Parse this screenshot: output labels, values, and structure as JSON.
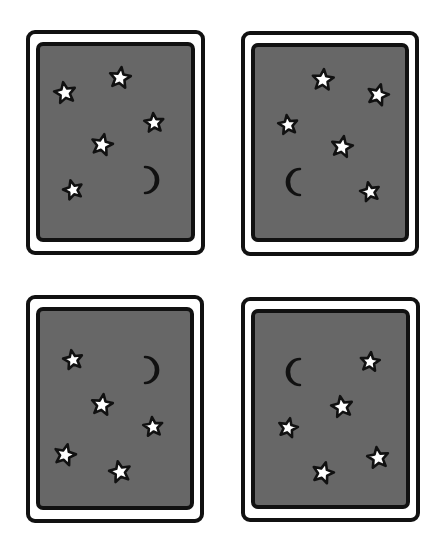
{
  "title": "Night sky cards",
  "colors": {
    "background": "#ffffff",
    "outline": "#111111",
    "frame": "#ffffff",
    "panel": "#676767",
    "star_fill": "#ffffff",
    "moon_fill": "#ffffff"
  },
  "cards": [
    {
      "id": "card-1",
      "label": "Card 1: five stars and a crescent moon (lower right)",
      "outer": {
        "x": 28,
        "y": 32,
        "w": 175,
        "h": 221
      },
      "inner": {
        "x": 38,
        "y": 44,
        "w": 155,
        "h": 196
      },
      "stars": [
        {
          "x": 65,
          "y": 93,
          "r": 11,
          "rot": -10
        },
        {
          "x": 120,
          "y": 78,
          "r": 11,
          "rot": 8
        },
        {
          "x": 154,
          "y": 123,
          "r": 10,
          "rot": -5
        },
        {
          "x": 102,
          "y": 145,
          "r": 11,
          "rot": 12
        },
        {
          "x": 73,
          "y": 190,
          "r": 10,
          "rot": -15
        }
      ],
      "moon": {
        "x": 147,
        "y": 180,
        "r": 13,
        "facing": "right"
      }
    },
    {
      "id": "card-2",
      "label": "Card 2: five stars and a crescent moon (lower left)",
      "outer": {
        "x": 243,
        "y": 33,
        "w": 174,
        "h": 221
      },
      "inner": {
        "x": 253,
        "y": 45,
        "w": 154,
        "h": 195
      },
      "stars": [
        {
          "x": 323,
          "y": 80,
          "r": 11,
          "rot": 5
        },
        {
          "x": 378,
          "y": 95,
          "r": 11,
          "rot": 15
        },
        {
          "x": 288,
          "y": 125,
          "r": 10,
          "rot": -8
        },
        {
          "x": 342,
          "y": 147,
          "r": 11,
          "rot": 10
        },
        {
          "x": 370,
          "y": 192,
          "r": 10,
          "rot": -12
        }
      ],
      "moon": {
        "x": 298,
        "y": 182,
        "r": 13,
        "facing": "left"
      }
    },
    {
      "id": "card-3",
      "label": "Card 3: five stars and a crescent moon (upper right)",
      "outer": {
        "x": 28,
        "y": 297,
        "w": 174,
        "h": 224
      },
      "inner": {
        "x": 38,
        "y": 309,
        "w": 154,
        "h": 199
      },
      "stars": [
        {
          "x": 73,
          "y": 360,
          "r": 10,
          "rot": -10
        },
        {
          "x": 102,
          "y": 405,
          "r": 11,
          "rot": 8
        },
        {
          "x": 153,
          "y": 427,
          "r": 10,
          "rot": -6
        },
        {
          "x": 65,
          "y": 455,
          "r": 11,
          "rot": 14
        },
        {
          "x": 120,
          "y": 472,
          "r": 11,
          "rot": -12
        }
      ],
      "moon": {
        "x": 147,
        "y": 370,
        "r": 13,
        "facing": "right"
      }
    },
    {
      "id": "card-4",
      "label": "Card 4: five stars and a crescent moon (upper left)",
      "outer": {
        "x": 243,
        "y": 299,
        "w": 175,
        "h": 221
      },
      "inner": {
        "x": 253,
        "y": 311,
        "w": 155,
        "h": 196
      },
      "stars": [
        {
          "x": 370,
          "y": 362,
          "r": 10,
          "rot": 6
        },
        {
          "x": 342,
          "y": 407,
          "r": 11,
          "rot": -10
        },
        {
          "x": 288,
          "y": 428,
          "r": 10,
          "rot": 12
        },
        {
          "x": 378,
          "y": 458,
          "r": 11,
          "rot": -8
        },
        {
          "x": 323,
          "y": 473,
          "r": 11,
          "rot": 15
        }
      ],
      "moon": {
        "x": 298,
        "y": 372,
        "r": 13,
        "facing": "left"
      }
    }
  ]
}
